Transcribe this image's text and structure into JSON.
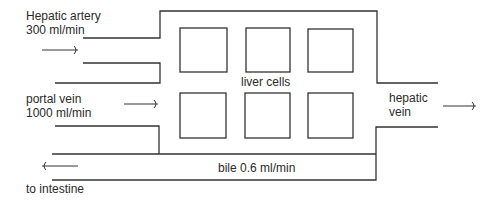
{
  "diagram": {
    "labels": {
      "hepatic_artery_name": "Hepatic artery",
      "hepatic_artery_flow": "300 ml/min",
      "portal_vein_name": "portal vein",
      "portal_vein_flow": "1000 ml/min",
      "liver_cells": "liver cells",
      "hepatic_vein_line1": "hepatic",
      "hepatic_vein_line2": "vein",
      "bile": "bile 0.6 ml/min",
      "to_intestine": "to intestine"
    },
    "cells": {
      "rows": 2,
      "columns": 3
    },
    "flows": [
      {
        "from": "Hepatic artery",
        "to": "liver",
        "rate_ml_min": 300,
        "direction": "right"
      },
      {
        "from": "portal vein",
        "to": "liver",
        "rate_ml_min": 1000,
        "direction": "right"
      },
      {
        "from": "liver",
        "to": "hepatic vein",
        "direction": "right"
      },
      {
        "from": "liver",
        "to": "intestine",
        "via": "bile",
        "rate_ml_min": 0.6,
        "direction": "left"
      }
    ]
  }
}
